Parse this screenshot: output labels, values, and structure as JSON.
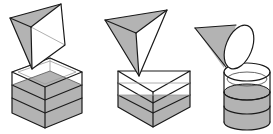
{
  "figure": {
    "title": "",
    "colors": {
      "stroke": "#1a1a1a",
      "shade": "#b3b3b3",
      "background": "#ffffff"
    },
    "panels": [
      {
        "id": "panel-1",
        "top_shape": "square-pyramid",
        "container": "cube",
        "layers_total": 4,
        "layers_shaded": 2
      },
      {
        "id": "panel-2",
        "top_shape": "triangular-pyramid",
        "container": "triangular-prism",
        "layers_total": 4,
        "layers_shaded": 2
      },
      {
        "id": "panel-3",
        "top_shape": "cone",
        "container": "cylinder",
        "layers_total": 4,
        "layers_shaded": 3
      }
    ]
  }
}
